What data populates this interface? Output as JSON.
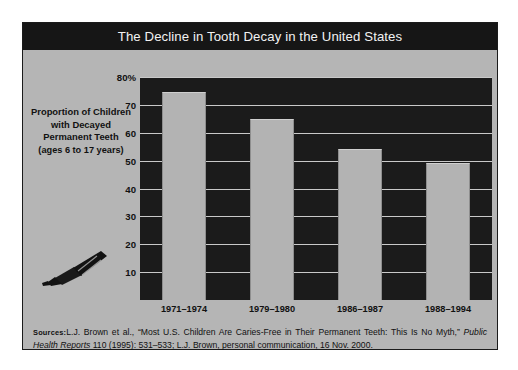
{
  "figure": {
    "title": "The Decline in Tooth Decay in the United States",
    "axis_caption_main": "Proportion of Children with Decayed Permanent Teeth",
    "axis_caption_sub": "(ages 6 to 17 years)",
    "icon": "toothpaste-tube-icon",
    "source_label": "Sources:",
    "source_text_1": "L.J. Brown et al., “Most U.S. Children Are Caries-Free in Their Permanent Teeth: This Is No Myth,” ",
    "source_italic": "Public Health Reports",
    "source_text_2": " 110 (1995): 531–533; L.J. Brown, personal communication, 16 Nov. 2000."
  },
  "colors": {
    "frame_border": "#1b1b1b",
    "panel_background": "#b5b5b5",
    "title_bar": "#161616",
    "title_text": "#f2f2f2",
    "plot_background": "#1b1b1b",
    "bar_fill": "#b3b3b3",
    "gridline": "#c9c9c9",
    "text": "#111111"
  },
  "chart_data": {
    "type": "bar",
    "title": "The Decline in Tooth Decay in the United States",
    "xlabel": "",
    "ylabel": "Proportion of Children with Decayed Permanent Teeth (ages 6 to 17 years)",
    "categories": [
      "1971–1974",
      "1979–1980",
      "1986–1987",
      "1988–1994"
    ],
    "values": [
      74.5,
      65,
      54,
      49
    ],
    "ylim": [
      0,
      80
    ],
    "yticks": [
      10,
      20,
      30,
      40,
      50,
      60,
      70,
      80
    ],
    "ytick_labels": [
      "10",
      "20",
      "30",
      "40",
      "50",
      "60",
      "70",
      "80%"
    ],
    "grid": true,
    "legend": "none",
    "units": "percent"
  }
}
